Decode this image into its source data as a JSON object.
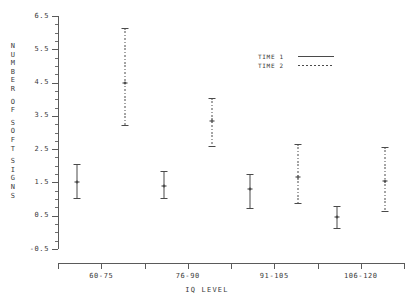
{
  "chart_data": {
    "type": "scatter",
    "title": "",
    "xlabel": "IQ LEVEL",
    "ylabel": "NUMBER OF SOFT SIGNS",
    "ylim": [
      -0.5,
      6.5
    ],
    "ytick_labels": [
      "6.5",
      "5.5",
      "4.5",
      "3.5",
      "2.5",
      "1.5",
      "0.5",
      "-0.5"
    ],
    "ytick_values": [
      6.5,
      5.5,
      4.5,
      3.5,
      2.5,
      1.5,
      0.5,
      -0.5
    ],
    "yminor_step": 0.25,
    "grid": false,
    "legend_position": "upper right",
    "categories": [
      "60-75",
      "76-90",
      "91-105",
      "106-120"
    ],
    "series": [
      {
        "name": "TIME 1",
        "style": "solid",
        "values": [
          1.5,
          1.4,
          1.3,
          0.45
        ],
        "lower": [
          1.0,
          1.0,
          0.7,
          0.1
        ],
        "upper": [
          2.05,
          1.85,
          1.75,
          0.8
        ]
      },
      {
        "name": "TIME 2",
        "style": "dashed",
        "values": [
          4.5,
          3.35,
          1.65,
          1.55
        ],
        "lower": [
          3.2,
          2.55,
          0.85,
          0.6
        ],
        "upper": [
          6.15,
          4.05,
          2.65,
          2.55
        ]
      }
    ]
  },
  "axes": {
    "y_title_letters": [
      "N",
      "U",
      "M",
      "B",
      "E",
      "R",
      "",
      "O",
      "F",
      "",
      "S",
      "O",
      "F",
      "T",
      "",
      "S",
      "I",
      "G",
      "N",
      "S"
    ],
    "x_title": "IQ LEVEL"
  },
  "legend": {
    "entries": [
      {
        "label": "TIME 1",
        "style": "solid"
      },
      {
        "label": "TIME 2",
        "style": "dashed"
      }
    ]
  },
  "colors": {
    "series_line": "#4a4a4a",
    "axis": "#5a5a5a",
    "text": "#3a3a3a",
    "background": "#ffffff"
  }
}
